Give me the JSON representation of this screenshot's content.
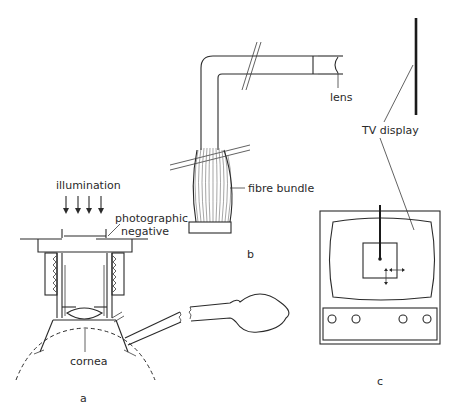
{
  "figure": {
    "panels": [
      {
        "id": "a",
        "label": "a"
      },
      {
        "id": "b",
        "label": "b"
      },
      {
        "id": "c",
        "label": "c"
      }
    ],
    "labels": {
      "illumination": "illumination",
      "photographic": "photographic",
      "negative": "negative",
      "cornea": "cornea",
      "fibre_bundle": "fibre bundle",
      "lens": "lens",
      "tv_display": "TV display"
    },
    "colors": {
      "ink": "#2a2a2a",
      "background": "#ffffff"
    }
  }
}
